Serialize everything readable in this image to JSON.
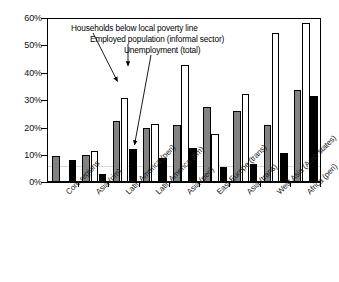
{
  "chart_data": {
    "type": "bar",
    "title": "",
    "subtitle": "",
    "xlabel": "",
    "ylabel": "",
    "ylim": [
      0,
      60
    ],
    "ytick_labels": [
      "0%",
      "10%",
      "20%",
      "30%",
      "40%",
      "50%",
      "60%"
    ],
    "ytick_values": [
      0,
      10,
      20,
      30,
      40,
      50,
      60
    ],
    "grid": false,
    "legend_position": "none",
    "categories": [
      "Core regions",
      "Asia (rim)",
      "Latin America (peri)",
      "Latin America (rim)",
      "Asia (peri)",
      "East Europe (trans)",
      "Asia (trans)",
      "West Asia (Arab states)",
      "Africa (peri)"
    ],
    "series": [
      {
        "name": "Households below local poverty line",
        "color": "#828282",
        "values": [
          9.5,
          10.0,
          22.5,
          20.0,
          21.0,
          27.5,
          26.0,
          21.0,
          34.0
        ]
      },
      {
        "name": "Employed population (informal sector)",
        "color": "#ffffff",
        "values": [
          null,
          11.5,
          31.0,
          21.5,
          43.0,
          17.5,
          32.5,
          55.0,
          58.5
        ]
      },
      {
        "name": "Unemployment (total)",
        "color": "#000000",
        "values": [
          8.0,
          3.0,
          12.0,
          9.0,
          12.5,
          5.5,
          6.5,
          10.5,
          31.5
        ]
      }
    ],
    "annotations": [
      {
        "text": "Households below local poverty line",
        "points_to_series": "Households below local poverty line",
        "points_to_category": "Latin America (peri)"
      },
      {
        "text": "Employed population (informal sector)",
        "points_to_series": "Employed population (informal sector)",
        "points_to_category": "Latin America (peri)"
      },
      {
        "text": "Unemployment (total)",
        "points_to_series": "Unemployment (total)",
        "points_to_category": "Latin America (peri)"
      }
    ]
  }
}
